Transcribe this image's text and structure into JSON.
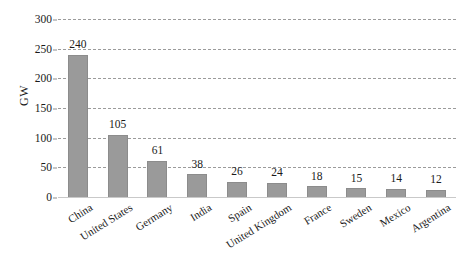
{
  "chart_data": {
    "type": "bar",
    "title": "",
    "xlabel": "",
    "ylabel": "GW",
    "categories": [
      "China",
      "United States",
      "Germany",
      "India",
      "Spain",
      "United Kingdom",
      "France",
      "Sweden",
      "Mexico",
      "Argentina"
    ],
    "values": [
      240,
      105,
      61,
      38,
      26,
      24,
      18,
      15,
      14,
      12
    ],
    "ylim": [
      0,
      300
    ],
    "ytick_labels": [
      "0",
      "50",
      "100",
      "150",
      "200",
      "250",
      "300"
    ],
    "ytick_values": [
      0,
      50,
      100,
      150,
      200,
      250,
      300
    ],
    "grid": "horizontal-dashed",
    "legend": "none",
    "bar_color": "#9a9a9a",
    "grid_color": "#9b9b9b",
    "background_color": "#ffffff",
    "data_labels": [
      "240",
      "105",
      "61",
      "38",
      "26",
      "24",
      "18",
      "15",
      "14",
      "12"
    ]
  }
}
